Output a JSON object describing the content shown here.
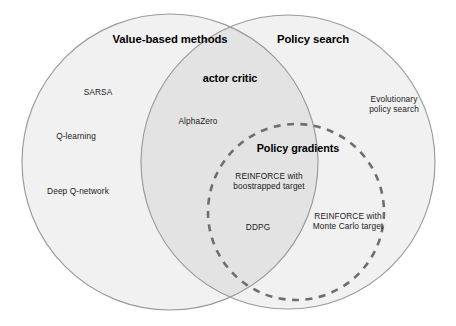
{
  "figure": {
    "type": "venn-diagram",
    "title_text": "",
    "background_color": "#ffffff"
  },
  "sets": {
    "value_based": {
      "label": "Value-based methods",
      "style": "solid",
      "fill": "#f1f1f1",
      "stroke": "#9a9a9a",
      "center": [
        170,
        162
      ],
      "radius": 148
    },
    "policy_search": {
      "label": "Policy search",
      "style": "solid",
      "fill": "#f1f1f1",
      "stroke": "#9a9a9a",
      "center": [
        288,
        162
      ],
      "radius": 147
    },
    "intersection": {
      "label": "actor critic",
      "fill": "#e3e3e3"
    },
    "policy_gradients": {
      "label": "Policy gradients",
      "style": "dashed",
      "fill": "none",
      "stroke": "#6e6e6e",
      "center": [
        296,
        212
      ],
      "radius": 88
    }
  },
  "headers": [
    {
      "id": "value-based-methods",
      "text": "Value-based methods",
      "x": 170,
      "y": 40,
      "size": "main"
    },
    {
      "id": "policy-search",
      "text": "Policy search",
      "x": 313,
      "y": 40,
      "size": "main"
    },
    {
      "id": "actor-critic",
      "text": "actor critic",
      "x": 230,
      "y": 78,
      "size": "sub"
    },
    {
      "id": "policy-gradients",
      "text": "Policy gradients",
      "x": 298,
      "y": 148,
      "size": "sub"
    }
  ],
  "items": [
    {
      "id": "sarsa",
      "text": "SARSA",
      "x": 98,
      "y": 93,
      "region": "value-based-only"
    },
    {
      "id": "q-learning",
      "text": "Q-learning",
      "x": 76,
      "y": 137,
      "region": "value-based-only"
    },
    {
      "id": "deep-q-network",
      "text": "Deep Q-network",
      "x": 78,
      "y": 192,
      "region": "value-based-only"
    },
    {
      "id": "alphazero",
      "text": "AlphaZero",
      "x": 198,
      "y": 122,
      "region": "actor-critic"
    },
    {
      "id": "evolutionary-policy-search",
      "text": "Evolutionary\npolicy search",
      "x": 394,
      "y": 105,
      "region": "policy-search-only"
    },
    {
      "id": "reinforce-bootstrapped",
      "text": "REINFORCE with\nboostrapped target",
      "x": 269,
      "y": 182,
      "region": "actor-critic-policy-gradients"
    },
    {
      "id": "ddpg",
      "text": "DDPG",
      "x": 258,
      "y": 228,
      "region": "actor-critic-policy-gradients"
    },
    {
      "id": "reinforce-monte-carlo",
      "text": "REINFORCE with\nMonte Carlo target",
      "x": 348,
      "y": 222,
      "region": "policy-search-policy-gradients"
    }
  ]
}
